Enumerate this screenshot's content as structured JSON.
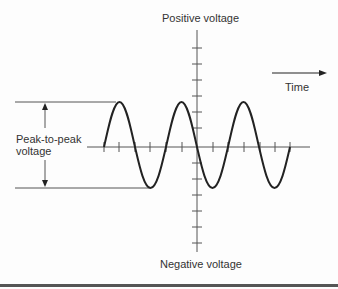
{
  "labels": {
    "y_top": "Positive voltage",
    "y_bottom": "Negative voltage",
    "x_axis": "Time",
    "measure_line1": "Peak-to-peak",
    "measure_line2": "voltage"
  },
  "colors": {
    "line": "#222222",
    "axis": "#555555",
    "text": "#333333"
  }
}
